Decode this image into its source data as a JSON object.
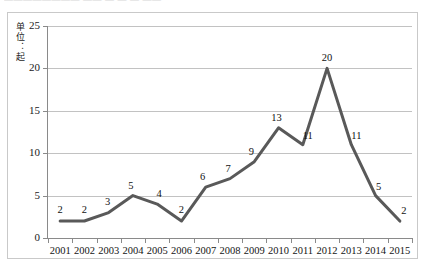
{
  "top_clipped_text": "————————  —— — — — ——",
  "axis": {
    "y_title": "单位：起"
  },
  "colors": {
    "line": "#595959",
    "grid": "#c2c2c2",
    "axis": "#8a8a8a",
    "frame": "#c9c9c9",
    "text": "#141414",
    "background": "#ffffff"
  },
  "chart_data": {
    "type": "line",
    "title": "",
    "xlabel": "",
    "ylabel": "单位：起",
    "categories": [
      "2001",
      "2002",
      "2003",
      "2004",
      "2005",
      "2006",
      "2007",
      "2008",
      "2009",
      "2010",
      "2011",
      "2012",
      "2013",
      "2014",
      "2015"
    ],
    "values": [
      2,
      2,
      3,
      5,
      4,
      2,
      6,
      7,
      9,
      13,
      11,
      20,
      11,
      5,
      2
    ],
    "data_labels": [
      "2",
      "2",
      "3",
      "5",
      "4",
      "2",
      "6",
      "7",
      "9",
      "13",
      "11",
      "20",
      "11",
      "5",
      "2"
    ],
    "ylim": [
      0,
      25
    ],
    "ytick_labels": [
      "0",
      "5",
      "10",
      "15",
      "20",
      "25"
    ],
    "ytick_values": [
      0,
      5,
      10,
      15,
      20,
      25
    ],
    "grid": true,
    "grid_axis": "y",
    "legend": false,
    "legend_position": "none",
    "markers": false,
    "line_width": 3
  }
}
